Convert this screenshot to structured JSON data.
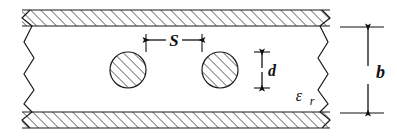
{
  "figure": {
    "type": "engineering-cross-section",
    "background_color": "#ffffff",
    "line_color": "#1a1a1a"
  },
  "labels": {
    "spacing": "S",
    "diameter": "d",
    "height": "b",
    "permittivity": "ε",
    "permittivity_subscript": "r"
  },
  "geometry": {
    "width": 397,
    "height": 136,
    "top_plate": {
      "y_outer": 10,
      "y_inner": 26,
      "x_left": 22,
      "x_right": 330
    },
    "bottom_plate": {
      "y_inner": 112,
      "y_outer": 128,
      "x_left": 22,
      "x_right": 330
    },
    "circles": [
      {
        "cx": 128,
        "cy": 70,
        "r": 18
      },
      {
        "cx": 220,
        "cy": 70,
        "r": 18
      }
    ],
    "hatch_angle_deg": 45,
    "hatch_spacing": 5
  },
  "dimensions": {
    "spacing_line": {
      "y": 40,
      "x_start": 146,
      "x_end": 202,
      "label_x": 174,
      "label_y": 46
    },
    "diameter_line": {
      "x": 262,
      "y_start": 52,
      "y_end": 88,
      "label_x": 270,
      "label_y": 76
    },
    "height_line": {
      "x": 368,
      "y_start": 27,
      "y_end": 113,
      "label_x": 376,
      "label_y": 76
    },
    "permittivity_label": {
      "x": 300,
      "y": 100,
      "sub_x": 315,
      "sub_y": 104
    }
  }
}
